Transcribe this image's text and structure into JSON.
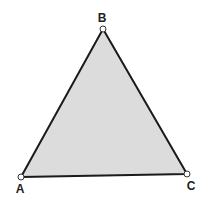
{
  "diagram": {
    "type": "triangle",
    "fill": "#dcdcdc",
    "stroke": "#1a1a1a",
    "vertices": [
      {
        "label": "A",
        "x": 21,
        "y": 177,
        "label_x": 20,
        "label_y": 193
      },
      {
        "label": "B",
        "x": 103,
        "y": 29,
        "label_x": 102,
        "label_y": 22
      },
      {
        "label": "C",
        "x": 187,
        "y": 174,
        "label_x": 191,
        "label_y": 190
      }
    ]
  }
}
